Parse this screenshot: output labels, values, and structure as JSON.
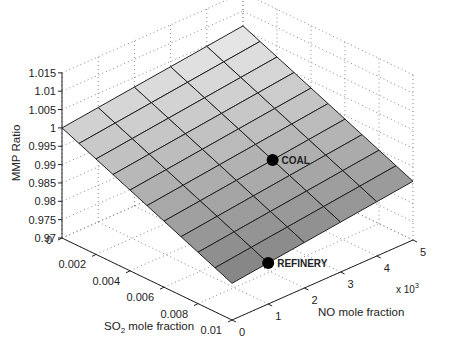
{
  "chart_data": {
    "type": "surface3d",
    "title": "",
    "xlabel": "SO2 mole fraction",
    "xlabel_parts": {
      "base": "SO",
      "sub": "2",
      "rest": " mole fraction"
    },
    "ylabel": "NO mole fraction",
    "zlabel": "MMP Ratio",
    "x_multiplier_label": {
      "base": "x 10",
      "sup": "3"
    },
    "xlim": [
      0,
      0.01
    ],
    "ylim": [
      0,
      5
    ],
    "zlim": [
      0.97,
      1.015
    ],
    "x_ticks": [
      0,
      0.002,
      0.004,
      0.006,
      0.008,
      0.01
    ],
    "x_tick_labels": [
      "0",
      "0.002",
      "0.004",
      "0.006",
      "0.008",
      "0.01"
    ],
    "y_ticks": [
      0,
      1,
      2,
      3,
      4,
      5
    ],
    "y_tick_labels": [
      "0",
      "1",
      "2",
      "3",
      "4",
      "5"
    ],
    "z_ticks": [
      0.97,
      0.975,
      0.98,
      0.985,
      0.99,
      0.995,
      1,
      1.005,
      1.01,
      1.015
    ],
    "z_tick_labels": [
      "0.97",
      "0.975",
      "0.98",
      "0.985",
      "0.99",
      "0.995",
      "1",
      "1.005",
      "1.01",
      "1.015"
    ],
    "grid": true,
    "surface": {
      "x": [
        0,
        0.001,
        0.002,
        0.003,
        0.004,
        0.005,
        0.006,
        0.007,
        0.008,
        0.009,
        0.01
      ],
      "y": [
        0,
        1,
        2,
        3,
        4,
        5
      ],
      "model": "z = 1 - 2.0*SO2 + 0.0012*NO_e3",
      "corner_values": {
        "so2_0_no_0": 1.0,
        "so2_0_no_5": 1.006,
        "so2_0.01_no_0": 0.98,
        "so2_0.01_no_5": 0.986
      }
    },
    "points": [
      {
        "label": "COAL",
        "x": 0.006,
        "y": 3,
        "z": 0.9916
      },
      {
        "label": "REFINERY",
        "x": 0.01,
        "y": 1,
        "z": 0.9812
      }
    ]
  }
}
